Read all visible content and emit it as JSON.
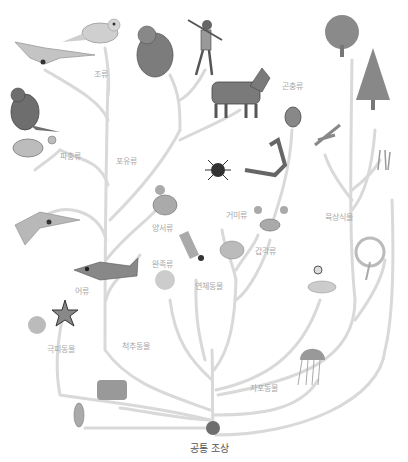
{
  "diagram": {
    "root": {
      "label": "공통 조상",
      "color": "#6e6e6e"
    },
    "branch_color": "#d9d9d9",
    "labels": [
      {
        "id": "birds",
        "text": "조류"
      },
      {
        "id": "reptiles",
        "text": "파충류"
      },
      {
        "id": "mammals",
        "text": "포유류"
      },
      {
        "id": "insects",
        "text": "곤충류"
      },
      {
        "id": "arachnids",
        "text": "거미류"
      },
      {
        "id": "amphibians",
        "text": "양서류"
      },
      {
        "id": "land-plants",
        "text": "육상식물"
      },
      {
        "id": "crustaceans",
        "text": "갑각류"
      },
      {
        "id": "bivalves",
        "text": "완족류"
      },
      {
        "id": "mollusks",
        "text": "연체동물"
      },
      {
        "id": "fish",
        "text": "어류"
      },
      {
        "id": "echinoderms",
        "text": "극피동물"
      },
      {
        "id": "chordates",
        "text": "척추동물"
      },
      {
        "id": "cnidarians",
        "text": "자포동물"
      }
    ],
    "organisms": [
      "pterosaur",
      "bird",
      "gorilla",
      "human",
      "horse",
      "dinosaur",
      "turtle",
      "beetle",
      "deciduous-tree",
      "conifer-tree",
      "fern",
      "flowering-plant",
      "spider",
      "scorpion",
      "frog",
      "crab",
      "swordfish",
      "shark",
      "squid",
      "trilobite",
      "shell",
      "snake",
      "coral-tree",
      "starfish",
      "sea-urchin",
      "jellyfish",
      "sponge",
      "bacterium"
    ]
  }
}
